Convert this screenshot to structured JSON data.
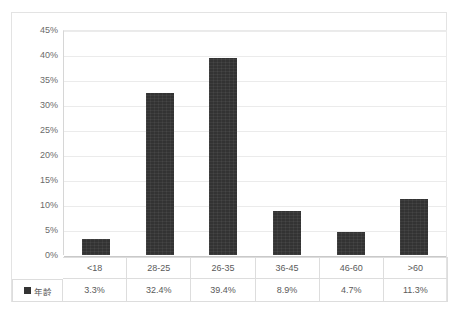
{
  "chart_data": {
    "type": "bar",
    "title": "",
    "xlabel": "",
    "ylabel": "",
    "categories": [
      "<18",
      "28-25",
      "26-35",
      "36-45",
      "46-60",
      ">60"
    ],
    "values": [
      3.3,
      32.4,
      39.4,
      8.9,
      4.7,
      11.3
    ],
    "value_labels": [
      "3.3%",
      "32.4%",
      "39.4%",
      "8.9%",
      "4.7%",
      "11.3%"
    ],
    "series": [
      {
        "name": "年龄",
        "values": [
          3.3,
          32.4,
          39.4,
          8.9,
          4.7,
          11.3
        ],
        "color": "#333333"
      }
    ],
    "ylim": [
      0,
      45
    ],
    "y_ticks": [
      45,
      40,
      35,
      30,
      25,
      20,
      15,
      10,
      5,
      0
    ],
    "y_tick_labels": [
      "45%",
      "40%",
      "35%",
      "30%",
      "25%",
      "20%",
      "15%",
      "10%",
      "5%",
      "0%"
    ],
    "grid": true,
    "legend_position": "data-table-left",
    "has_data_table": true
  },
  "legend": {
    "series_label": "年龄",
    "swatch_color": "#333333"
  },
  "top_clipped_text": "     ",
  "colors": {
    "bar": "#333333",
    "gridline": "#ebebeb",
    "axis": "#c9c9c9",
    "frame": "#e3e3e3",
    "text": "#5a5a5a",
    "table_border": "#dddddd"
  }
}
